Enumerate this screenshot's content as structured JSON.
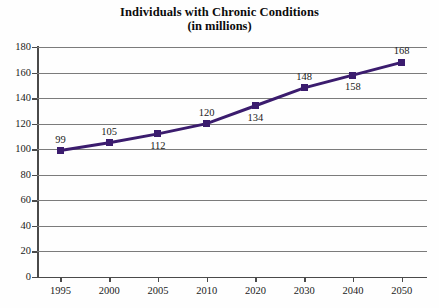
{
  "chart_data": {
    "type": "line",
    "title": "Individuals with Chronic Conditions",
    "subtitle": "(in millions)",
    "xlabel": "",
    "ylabel": "",
    "categories": [
      "1995",
      "2000",
      "2005",
      "2010",
      "2020",
      "2030",
      "2040",
      "2050"
    ],
    "values": [
      99,
      105,
      112,
      120,
      134,
      148,
      158,
      168
    ],
    "point_labels": [
      "99",
      "105",
      "112",
      "120",
      "134",
      "148",
      "158",
      "168"
    ],
    "label_positions": [
      "above",
      "above",
      "below",
      "above",
      "below",
      "above",
      "below",
      "above"
    ],
    "ylim": [
      0,
      180
    ],
    "ytick_labels": [
      "180",
      "160",
      "140",
      "120",
      "100",
      "80",
      "60",
      "40",
      "20",
      "0"
    ],
    "ytick_values": [
      180,
      160,
      140,
      120,
      100,
      80,
      60,
      40,
      20,
      0
    ],
    "grid": true,
    "legend": false,
    "series_color": "#3B1C6E",
    "marker": "square",
    "axis_color": "#4a4a4a",
    "grid_color": "#7b7b7b"
  },
  "footer": {
    "caption": ""
  }
}
